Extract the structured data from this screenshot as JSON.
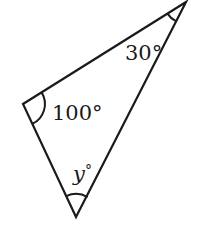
{
  "diagram": {
    "type": "triangle",
    "stroke_color": "#1a1a1a",
    "vertices": {
      "top": {
        "x": 186,
        "y": 2
      },
      "left": {
        "x": 23,
        "y": 104
      },
      "bottom": {
        "x": 76,
        "y": 217
      }
    },
    "angles": [
      {
        "vertex": "top",
        "value": "30",
        "label": "30°",
        "italic": false
      },
      {
        "vertex": "left",
        "value": "100",
        "label": "100°",
        "italic": false
      },
      {
        "vertex": "bottom",
        "value": "y",
        "label_var": "y",
        "label_deg": "°",
        "italic": true
      }
    ]
  }
}
